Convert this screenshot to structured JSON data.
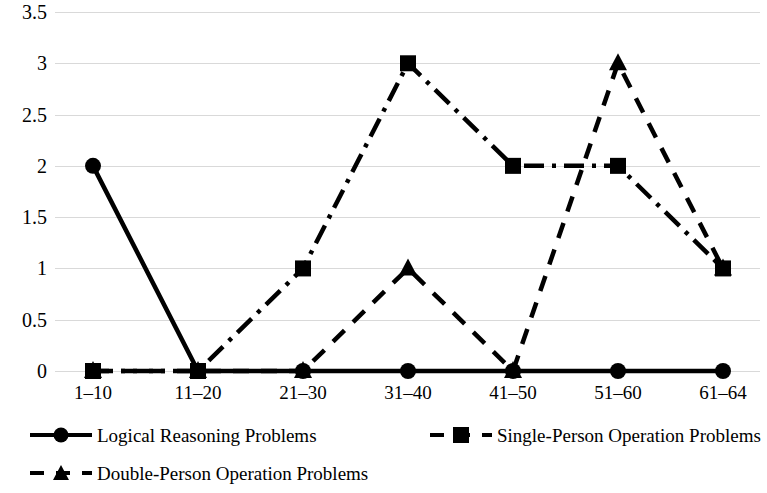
{
  "chart_data": {
    "type": "line",
    "title": "",
    "xlabel": "",
    "ylabel": "",
    "categories": [
      "1–10",
      "11–20",
      "21–30",
      "31–40",
      "41–50",
      "51–60",
      "61–64"
    ],
    "ylim": [
      0,
      3.5
    ],
    "y_ticks": [
      "0",
      "0.5",
      "1",
      "1.5",
      "2",
      "2.5",
      "3",
      "3.5"
    ],
    "y_tick_values": [
      0,
      0.5,
      1,
      1.5,
      2,
      2.5,
      3,
      3.5
    ],
    "grid": true,
    "legend_position": "bottom",
    "series": [
      {
        "name": "Logical Reasoning Problems",
        "values": [
          2,
          0,
          0,
          0,
          0,
          0,
          0
        ],
        "marker": "circle",
        "line_style": "solid",
        "color": "#000000"
      },
      {
        "name": "Single-Person Operation Problems",
        "values": [
          0,
          0,
          1,
          3,
          2,
          2,
          1
        ],
        "marker": "square",
        "line_style": "dash-dot",
        "color": "#000000"
      },
      {
        "name": "Double-Person Operation Problems",
        "values": [
          0,
          0,
          0,
          1,
          0,
          3,
          1
        ],
        "marker": "triangle",
        "line_style": "dashed",
        "color": "#000000"
      }
    ]
  },
  "legend": {
    "items": [
      {
        "label": "Logical Reasoning Problems"
      },
      {
        "label": "Single-Person Operation Problems"
      },
      {
        "label": "Double-Person Operation Problems"
      }
    ]
  },
  "colors": {
    "series": "#000000",
    "gridline": "#d9d9d9",
    "background": "#ffffff",
    "text": "#000000"
  }
}
